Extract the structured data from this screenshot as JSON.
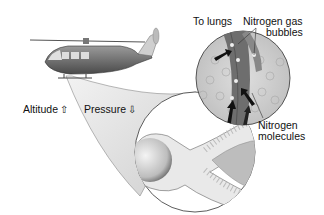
{
  "diagram": {
    "labels": {
      "altitude": "Altitude",
      "altitude_arrow": "up-arrow",
      "pressure": "Pressure",
      "pressure_arrow": "down-arrow",
      "to_lungs": "To lungs",
      "nitrogen_gas": "Nitrogen gas",
      "bubbles": "bubbles",
      "nitrogen": "Nitrogen",
      "molecules": "molecules"
    },
    "elements": [
      "helicopter",
      "body-magnifier-circle",
      "tissue-magnifier-circle",
      "blood-vessel",
      "flow-arrows",
      "nitrogen-bubbles",
      "nitrogen-molecules"
    ],
    "colors": {
      "helicopter_body": "#6d6d6d",
      "helicopter_light": "#cfcfcf",
      "cone_gradient": "#d8d8d8",
      "vessel": "#7a7a7a",
      "tissue": "#c8c8c8",
      "outline": "#3a3a3a"
    }
  }
}
